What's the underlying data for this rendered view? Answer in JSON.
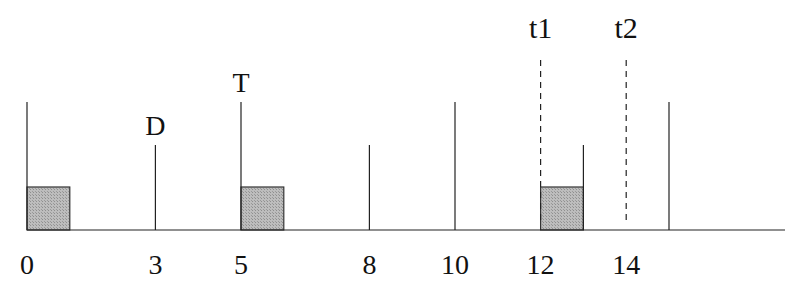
{
  "diagram": {
    "type": "timeline",
    "axis": {
      "tick_labels": [
        {
          "value": 0,
          "text": "0"
        },
        {
          "value": 3,
          "text": "3"
        },
        {
          "value": 5,
          "text": "5"
        },
        {
          "value": 8,
          "text": "8"
        },
        {
          "value": 10,
          "text": "10"
        },
        {
          "value": 12,
          "text": "12"
        },
        {
          "value": 14,
          "text": "14"
        }
      ]
    },
    "tall_markers": [
      0,
      5,
      10,
      15
    ],
    "short_markers": [
      3,
      8,
      13
    ],
    "boxes": [
      {
        "start": 0,
        "end": 1
      },
      {
        "start": 5,
        "end": 6
      },
      {
        "start": 12,
        "end": 13
      }
    ],
    "dashed_markers": [
      {
        "value": 12,
        "label": "t1"
      },
      {
        "value": 14,
        "label": "t2"
      }
    ],
    "marker_labels": [
      {
        "value": 3,
        "text": "D"
      },
      {
        "value": 5,
        "text": "T"
      }
    ],
    "colors": {
      "line": "#222222",
      "box_fill": "#bdbdbd",
      "box_stroke": "#333333"
    }
  }
}
